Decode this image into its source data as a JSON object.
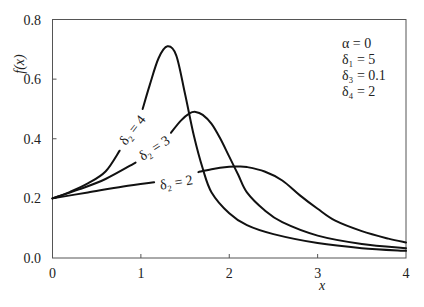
{
  "chart_data": {
    "type": "line",
    "title": "",
    "xlabel": "x",
    "ylabel": "f(x)",
    "xlim": [
      0,
      4
    ],
    "ylim": [
      0,
      0.8
    ],
    "grid": false,
    "legend_position": "none (inline curve labels)",
    "x_ticks": [
      "0",
      "1",
      "2",
      "3",
      "4"
    ],
    "y_ticks": [
      "0.0",
      "0.2",
      "0.4",
      "0.6",
      "0.8"
    ],
    "parameters_box": [
      "α = 0",
      "δ₁ = 5",
      "δ₃ = 0.1",
      "δ₄ = 2"
    ],
    "series": [
      {
        "name": "δ₂ = 4",
        "segments": [
          [
            [
              0,
              0.2
            ],
            [
              0.2,
              0.222
            ],
            [
              0.4,
              0.25
            ],
            [
              0.6,
              0.29
            ],
            [
              0.76,
              0.36
            ]
          ],
          [
            [
              1.02,
              0.5
            ],
            [
              1.1,
              0.58
            ],
            [
              1.2,
              0.67
            ],
            [
              1.3,
              0.71
            ],
            [
              1.4,
              0.68
            ],
            [
              1.5,
              0.55
            ],
            [
              1.6,
              0.41
            ],
            [
              1.7,
              0.3
            ],
            [
              1.8,
              0.22
            ],
            [
              2.0,
              0.15
            ],
            [
              2.2,
              0.11
            ],
            [
              2.5,
              0.08
            ],
            [
              3.0,
              0.05
            ],
            [
              3.5,
              0.033
            ],
            [
              4.0,
              0.024
            ]
          ]
        ],
        "label_pos": [
          0.9,
          0.43
        ],
        "label_angle": -52
      },
      {
        "name": "δ₂ = 3",
        "segments": [
          [
            [
              0,
              0.2
            ],
            [
              0.3,
              0.23
            ],
            [
              0.6,
              0.265
            ],
            [
              0.94,
              0.32
            ]
          ],
          [
            [
              1.34,
              0.42
            ],
            [
              1.45,
              0.46
            ],
            [
              1.55,
              0.485
            ],
            [
              1.62,
              0.49
            ],
            [
              1.7,
              0.48
            ],
            [
              1.8,
              0.45
            ],
            [
              1.9,
              0.4
            ],
            [
              2.0,
              0.34
            ],
            [
              2.1,
              0.28
            ],
            [
              2.2,
              0.22
            ],
            [
              2.4,
              0.16
            ],
            [
              2.6,
              0.12
            ],
            [
              3.0,
              0.075
            ],
            [
              3.5,
              0.047
            ],
            [
              4.0,
              0.033
            ]
          ]
        ],
        "label_pos": [
          1.15,
          0.37
        ],
        "label_angle": -33
      },
      {
        "name": "δ₂ = 2",
        "segments": [
          [
            [
              0,
              0.2
            ],
            [
              0.4,
              0.22
            ],
            [
              0.8,
              0.24
            ],
            [
              1.15,
              0.254
            ]
          ],
          [
            [
              1.65,
              0.288
            ],
            [
              1.8,
              0.298
            ],
            [
              2.0,
              0.306
            ],
            [
              2.1,
              0.307
            ],
            [
              2.2,
              0.305
            ],
            [
              2.4,
              0.29
            ],
            [
              2.6,
              0.26
            ],
            [
              2.8,
              0.21
            ],
            [
              3.0,
              0.165
            ],
            [
              3.2,
              0.125
            ],
            [
              3.5,
              0.09
            ],
            [
              3.8,
              0.065
            ],
            [
              4.0,
              0.052
            ]
          ]
        ],
        "label_pos": [
          1.4,
          0.255
        ],
        "label_angle": -10
      }
    ]
  },
  "axes": {
    "x_title": "x",
    "y_title": "f(x)"
  },
  "params": {
    "alpha": "α = 0",
    "delta1": "δ₁ = 5",
    "delta3": "δ₃ = 0.1",
    "delta4": "δ₄ = 2"
  },
  "labels": {
    "d2_4": "δ₂ = 4",
    "d2_3": "δ₂ = 3",
    "d2_2": "δ₂ = 2"
  }
}
